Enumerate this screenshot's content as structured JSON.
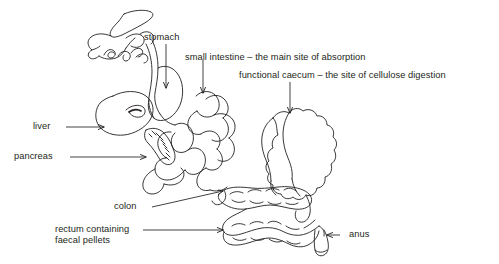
{
  "figure": {
    "type": "anatomical-line-drawing",
    "stroke_color": "#231f20",
    "background_color": "#ffffff",
    "text_color": "#231f20",
    "width": 499,
    "height": 264
  },
  "labels": {
    "stomach": "stomach",
    "small_intestine": "small intestine – the main site of absorption",
    "caecum": "functional caecum – the site of cellulose digestion",
    "liver": "liver",
    "pancreas": "pancreas",
    "colon": "colon",
    "rectum_line1": "rectum containing",
    "rectum_line2": "faecal pellets",
    "anus": "anus"
  },
  "parts": [
    {
      "name": "stomach",
      "leader": "vertical-arrow-down"
    },
    {
      "name": "small intestine",
      "leader": "vertical-arrow-down"
    },
    {
      "name": "functional caecum",
      "leader": "vertical-arrow-down"
    },
    {
      "name": "liver",
      "leader": "horizontal-arrow-right"
    },
    {
      "name": "pancreas",
      "leader": "horizontal-arrow-right"
    },
    {
      "name": "colon",
      "leader": "diagonal-arrow-up-right"
    },
    {
      "name": "rectum containing faecal pellets",
      "leader": "horizontal-arrow-right"
    },
    {
      "name": "anus",
      "leader": "horizontal-arrow-left"
    }
  ]
}
